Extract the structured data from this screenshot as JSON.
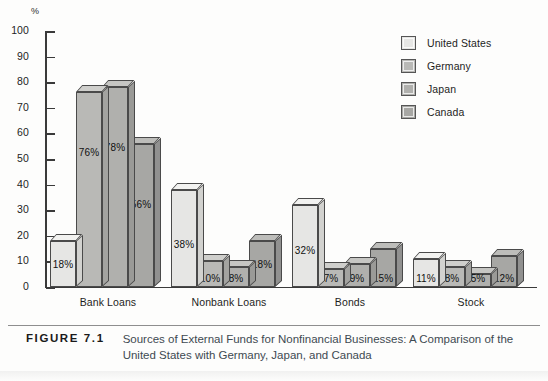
{
  "chart_data": {
    "type": "bar",
    "title": "Sources of External Funds for Nonfinancial Businesses: A Comparison of the United States with Germany, Japan, and Canada",
    "xlabel": "",
    "ylabel": "%",
    "ylim": [
      0,
      100
    ],
    "yticks": [
      100,
      90,
      80,
      70,
      60,
      50,
      40,
      30,
      20,
      10,
      0
    ],
    "grid": false,
    "legend_position": "top-right",
    "categories": [
      "Bank Loans",
      "Nonbank Loans",
      "Bonds",
      "Stock"
    ],
    "series": [
      {
        "name": "United States",
        "color": "#e6e6e4",
        "values": [
          18,
          38,
          32,
          11
        ],
        "labels": [
          "18%",
          "38%",
          "32%",
          "11%"
        ]
      },
      {
        "name": "Germany",
        "color": "#b9b9b6",
        "values": [
          76,
          10,
          7,
          8
        ],
        "labels": [
          "76%",
          "10%",
          "7%",
          "8%"
        ]
      },
      {
        "name": "Japan",
        "color": "#b0b0ad",
        "values": [
          78,
          8,
          9,
          5
        ],
        "labels": [
          "78%",
          "8%",
          "9%",
          "5%"
        ]
      },
      {
        "name": "Canada",
        "color": "#a7a7a4",
        "values": [
          56,
          18,
          15,
          12
        ],
        "labels": [
          "56%",
          "18%",
          "15%",
          "12%"
        ]
      }
    ]
  },
  "axis": {
    "unit_label": "%"
  },
  "legend": {
    "items": [
      {
        "label": "United States"
      },
      {
        "label": "Germany"
      },
      {
        "label": "Japan"
      },
      {
        "label": "Canada"
      }
    ]
  },
  "caption": {
    "figure_number": "FIGURE 7.1",
    "text": "Sources of External Funds for Nonfinancial Businesses: A Comparison of the United States with Germany, Japan, and Canada"
  }
}
